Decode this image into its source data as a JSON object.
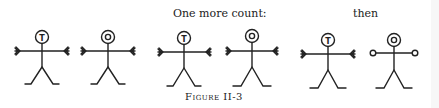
{
  "labels": {
    "one_more_count": "One more count:",
    "then": "then",
    "caption": "Figure II-3"
  },
  "figures": [
    {
      "id": 1,
      "head_letter": "T",
      "hands": "feathered",
      "cx": 42
    },
    {
      "id": 2,
      "head_letter": "O",
      "hands": "feathered",
      "cx": 108
    },
    {
      "id": 3,
      "head_letter": "T",
      "hands": "feathered",
      "cx": 184
    },
    {
      "id": 4,
      "head_letter": "O",
      "hands": "feathered",
      "cx": 252
    },
    {
      "id": 5,
      "head_letter": "T",
      "hands": "feathered",
      "cx": 327
    },
    {
      "id": 6,
      "head_letter": "O",
      "hands": "open-circles",
      "cx": 393
    }
  ]
}
